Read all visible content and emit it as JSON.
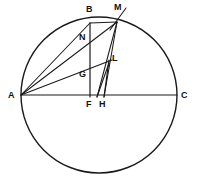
{
  "figure": {
    "kind": "geometry-diagram",
    "width": 209,
    "height": 188,
    "stroke_color": "#1a1a1a",
    "background_color": "#ffffff",
    "label_color": "#111111"
  },
  "circle": {
    "center_x": 99,
    "center_y": 95,
    "radius": 78,
    "stroke_width": 1.4
  },
  "points": [
    {
      "id": "A",
      "label": "A",
      "x": 21,
      "y": 95,
      "label_x": 8,
      "label_y": 91
    },
    {
      "id": "B",
      "label": "B",
      "x": 90,
      "y": 23,
      "label_x": 86,
      "label_y": 5
    },
    {
      "id": "M",
      "label": "M",
      "x": 117,
      "y": 22,
      "label_x": 114,
      "label_y": 3
    },
    {
      "id": "N",
      "label": "N",
      "x": 85,
      "y": 45,
      "label_x": 79,
      "label_y": 33
    },
    {
      "id": "L",
      "label": "L",
      "x": 109,
      "y": 63,
      "label_x": 112,
      "label_y": 54
    },
    {
      "id": "G",
      "label": "G",
      "x": 88,
      "y": 71,
      "label_x": 79,
      "label_y": 70
    },
    {
      "id": "F",
      "label": "F",
      "x": 90,
      "y": 95,
      "label_x": 86,
      "label_y": 100
    },
    {
      "id": "H",
      "label": "H",
      "x": 103,
      "y": 95,
      "label_x": 99,
      "label_y": 100
    },
    {
      "id": "C",
      "label": "C",
      "x": 177,
      "y": 95,
      "label_x": 181,
      "label_y": 91
    }
  ],
  "segments": [
    {
      "name": "diameter-AC",
      "from": "A",
      "to": "C",
      "x1": 21,
      "y1": 95,
      "x2": 177,
      "y2": 95
    },
    {
      "name": "chord-AB",
      "from": "A",
      "to": "B",
      "x1": 21,
      "y1": 95,
      "x2": 90,
      "y2": 23
    },
    {
      "name": "chord-AM",
      "from": "A",
      "to": "M",
      "x1": 21,
      "y1": 95,
      "x2": 117,
      "y2": 22
    },
    {
      "name": "ray-AL",
      "from": "A",
      "to": "L",
      "x1": 21,
      "y1": 95,
      "x2": 112,
      "y2": 60
    },
    {
      "name": "chord-BM",
      "from": "B",
      "to": "M",
      "x1": 90,
      "y1": 23,
      "x2": 117,
      "y2": 22
    },
    {
      "name": "perpendicular-BF",
      "from": "B",
      "to": "F",
      "x1": 90,
      "y1": 23,
      "x2": 90,
      "y2": 97
    },
    {
      "name": "perpendicular-LH",
      "from": "L",
      "to": "H",
      "x1": 109,
      "y1": 60,
      "x2": 104,
      "y2": 97
    },
    {
      "name": "segment-MF",
      "from": "M",
      "to": "F",
      "x1": 117,
      "y1": 22,
      "x2": 97,
      "y2": 97
    },
    {
      "name": "segment-MH",
      "from": "M",
      "to": "H",
      "x1": 117,
      "y1": 22,
      "x2": 104,
      "y2": 97
    },
    {
      "name": "segment-LF",
      "from": "L",
      "to": "F",
      "x1": 109,
      "y1": 63,
      "x2": 97,
      "y2": 97
    },
    {
      "name": "tangent-at-M",
      "from": "M",
      "to": "ext",
      "x1": 110,
      "y1": 30,
      "x2": 126,
      "y2": 8
    }
  ]
}
